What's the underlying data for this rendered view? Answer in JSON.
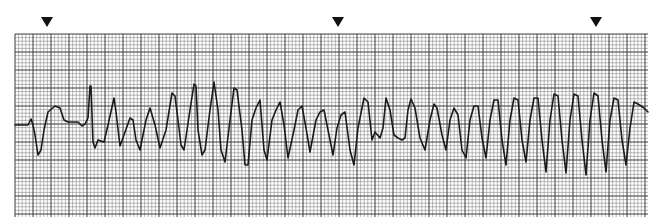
{
  "chart_data": {
    "type": "line",
    "title": "",
    "xlabel": "",
    "ylabel": "",
    "grid": true,
    "markers": [
      {
        "name": "arrowhead-1",
        "x": 47
      },
      {
        "name": "arrowhead-2",
        "x": 338
      },
      {
        "name": "arrowhead-3",
        "x": 596
      }
    ],
    "trace_points": [
      [
        15,
        125
      ],
      [
        28,
        125
      ],
      [
        31,
        119
      ],
      [
        33,
        125
      ],
      [
        35,
        135
      ],
      [
        38,
        155
      ],
      [
        41,
        150
      ],
      [
        44,
        130
      ],
      [
        48,
        112
      ],
      [
        55,
        106
      ],
      [
        60,
        108
      ],
      [
        64,
        120
      ],
      [
        68,
        122
      ],
      [
        78,
        122
      ],
      [
        82,
        126
      ],
      [
        85,
        124
      ],
      [
        88,
        118
      ],
      [
        90,
        86
      ],
      [
        91,
        86
      ],
      [
        93,
        142
      ],
      [
        95,
        148
      ],
      [
        98,
        140
      ],
      [
        104,
        142
      ],
      [
        108,
        125
      ],
      [
        114,
        98
      ],
      [
        116,
        112
      ],
      [
        120,
        146
      ],
      [
        124,
        135
      ],
      [
        130,
        118
      ],
      [
        133,
        120
      ],
      [
        136,
        140
      ],
      [
        140,
        150
      ],
      [
        146,
        120
      ],
      [
        150,
        108
      ],
      [
        155,
        125
      ],
      [
        160,
        148
      ],
      [
        166,
        130
      ],
      [
        172,
        93
      ],
      [
        175,
        96
      ],
      [
        178,
        120
      ],
      [
        181,
        145
      ],
      [
        184,
        150
      ],
      [
        190,
        110
      ],
      [
        194,
        84
      ],
      [
        196,
        86
      ],
      [
        198,
        130
      ],
      [
        202,
        155
      ],
      [
        205,
        150
      ],
      [
        210,
        110
      ],
      [
        214,
        82
      ],
      [
        218,
        110
      ],
      [
        221,
        150
      ],
      [
        225,
        162
      ],
      [
        230,
        120
      ],
      [
        234,
        88
      ],
      [
        237,
        90
      ],
      [
        242,
        130
      ],
      [
        245,
        165
      ],
      [
        248,
        165
      ],
      [
        252,
        120
      ],
      [
        256,
        108
      ],
      [
        260,
        100
      ],
      [
        264,
        150
      ],
      [
        267,
        160
      ],
      [
        272,
        120
      ],
      [
        276,
        110
      ],
      [
        280,
        102
      ],
      [
        284,
        125
      ],
      [
        288,
        158
      ],
      [
        294,
        130
      ],
      [
        298,
        110
      ],
      [
        302,
        106
      ],
      [
        306,
        128
      ],
      [
        310,
        152
      ],
      [
        316,
        120
      ],
      [
        320,
        112
      ],
      [
        324,
        110
      ],
      [
        328,
        130
      ],
      [
        333,
        155
      ],
      [
        337,
        128
      ],
      [
        341,
        115
      ],
      [
        345,
        112
      ],
      [
        350,
        150
      ],
      [
        354,
        165
      ],
      [
        358,
        128
      ],
      [
        364,
        98
      ],
      [
        368,
        102
      ],
      [
        372,
        140
      ],
      [
        375,
        132
      ],
      [
        380,
        138
      ],
      [
        383,
        128
      ],
      [
        386,
        98
      ],
      [
        390,
        110
      ],
      [
        394,
        135
      ],
      [
        398,
        138
      ],
      [
        402,
        140
      ],
      [
        405,
        138
      ],
      [
        408,
        110
      ],
      [
        411,
        99
      ],
      [
        415,
        108
      ],
      [
        420,
        138
      ],
      [
        425,
        150
      ],
      [
        430,
        120
      ],
      [
        434,
        104
      ],
      [
        437,
        108
      ],
      [
        442,
        135
      ],
      [
        446,
        150
      ],
      [
        450,
        120
      ],
      [
        454,
        108
      ],
      [
        458,
        115
      ],
      [
        462,
        150
      ],
      [
        466,
        158
      ],
      [
        470,
        120
      ],
      [
        474,
        106
      ],
      [
        478,
        106
      ],
      [
        482,
        138
      ],
      [
        486,
        158
      ],
      [
        490,
        120
      ],
      [
        494,
        100
      ],
      [
        498,
        100
      ],
      [
        502,
        140
      ],
      [
        506,
        165
      ],
      [
        510,
        120
      ],
      [
        514,
        98
      ],
      [
        518,
        100
      ],
      [
        522,
        140
      ],
      [
        526,
        162
      ],
      [
        530,
        120
      ],
      [
        534,
        98
      ],
      [
        538,
        98
      ],
      [
        542,
        140
      ],
      [
        546,
        172
      ],
      [
        550,
        120
      ],
      [
        554,
        94
      ],
      [
        558,
        96
      ],
      [
        562,
        140
      ],
      [
        566,
        173
      ],
      [
        570,
        120
      ],
      [
        574,
        94
      ],
      [
        578,
        96
      ],
      [
        582,
        140
      ],
      [
        586,
        175
      ],
      [
        590,
        120
      ],
      [
        594,
        93
      ],
      [
        598,
        96
      ],
      [
        602,
        140
      ],
      [
        606,
        172
      ],
      [
        610,
        120
      ],
      [
        614,
        98
      ],
      [
        618,
        100
      ],
      [
        622,
        140
      ],
      [
        626,
        165
      ],
      [
        630,
        128
      ],
      [
        634,
        102
      ],
      [
        638,
        104
      ],
      [
        644,
        108
      ],
      [
        648,
        112
      ]
    ]
  },
  "strip": {
    "background": "#ffffff",
    "grid_color_minor": "#8a8a8a",
    "grid_color_major": "#3a3a3a",
    "trace_color": "#1a1a1a",
    "marker_color": "#111111"
  }
}
